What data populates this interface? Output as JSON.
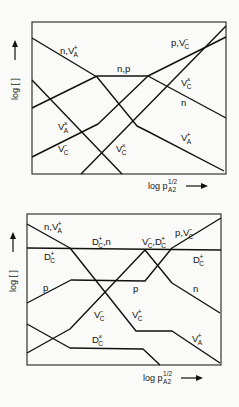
{
  "chart_data": [
    {
      "type": "line",
      "title": "",
      "xlabel": "log p_A2^1/2",
      "ylabel": "log [ ]",
      "grid": false,
      "frame": {
        "x0": 32,
        "y0": 22,
        "x1": 226,
        "y1": 174
      },
      "series": [
        {
          "name": "n, V_A+ / n / V_A+",
          "points": [
            [
              32,
              38
            ],
            [
              97,
              77
            ],
            [
              137,
              126
            ],
            [
              147,
              131
            ],
            [
              224,
              171
            ]
          ]
        },
        {
          "name": "p / n,p / p, V_C-",
          "points": [
            [
              32,
              108
            ],
            [
              97,
              76
            ],
            [
              148,
              76
            ],
            [
              226,
              37
            ]
          ]
        },
        {
          "name": "n (high pressure)",
          "points": [
            [
              148,
              76
            ],
            [
              226,
              118
            ]
          ]
        },
        {
          "name": "V_A^x",
          "points": [
            [
              32,
              80
            ],
            [
              122,
              174
            ]
          ]
        },
        {
          "name": "V_C-",
          "points": [
            [
              32,
              157
            ],
            [
              98,
              124
            ],
            [
              148,
              76
            ]
          ]
        },
        {
          "name": "V_C^x",
          "points": [
            [
              81,
              174
            ],
            [
              226,
              26
            ]
          ]
        }
      ],
      "labels": [
        {
          "base": "n,V",
          "sup": "+",
          "sub": "A",
          "x": 60,
          "y": 54
        },
        {
          "base": "n,p",
          "sup": "",
          "sub": "",
          "x": 117,
          "y": 72
        },
        {
          "base": "p,V",
          "sup": "−",
          "sub": "C",
          "x": 171,
          "y": 46
        },
        {
          "base": "V",
          "sup": "×",
          "sub": "C",
          "x": 181,
          "y": 86
        },
        {
          "base": "n",
          "sup": "",
          "sub": "",
          "x": 181,
          "y": 106
        },
        {
          "base": "V",
          "sup": "×",
          "sub": "A",
          "x": 58,
          "y": 130
        },
        {
          "base": "V",
          "sup": "−",
          "sub": "C",
          "x": 58,
          "y": 152
        },
        {
          "base": "V",
          "sup": "×",
          "sub": "C",
          "x": 116,
          "y": 152
        },
        {
          "base": "V",
          "sup": "+",
          "sub": "A",
          "x": 181,
          "y": 141
        }
      ],
      "x_axis_label": {
        "text": "log p",
        "sup": "1/2",
        "sub": "A2",
        "x": 148,
        "y": 189
      },
      "y_axis_label": {
        "text": "log [ ]",
        "x": 18,
        "y": 70
      }
    },
    {
      "type": "line",
      "title": "",
      "xlabel": "log p_A2^1/2",
      "ylabel": "log [ ]",
      "grid": false,
      "frame": {
        "x0": 27,
        "y0": 214,
        "x1": 221,
        "y1": 365
      },
      "series": [
        {
          "name": "D_C+ (constant)",
          "points": [
            [
              27,
              248
            ],
            [
              221,
              250
            ]
          ]
        },
        {
          "name": "n, V_A+ / V_C+ / V_A+",
          "points": [
            [
              27,
              224
            ],
            [
              70,
              248
            ],
            [
              136,
              331
            ],
            [
              172,
              331
            ],
            [
              220,
              363
            ]
          ]
        },
        {
          "name": "p / p, V_C-",
          "points": [
            [
              27,
              303
            ],
            [
              71,
              280
            ],
            [
              145,
              281
            ],
            [
              172,
              248
            ],
            [
              221,
              218
            ]
          ]
        },
        {
          "name": "V_C- / n",
          "points": [
            [
              27,
              353
            ],
            [
              70,
              329
            ],
            [
              145,
              250
            ],
            [
              172,
              283
            ],
            [
              220,
              313
            ]
          ]
        },
        {
          "name": "D_C^x",
          "points": [
            [
              27,
              324
            ],
            [
              70,
              348
            ],
            [
              143,
              349
            ],
            [
              160,
              365
            ]
          ]
        }
      ],
      "labels": [
        {
          "base": "n,V",
          "sup": "+",
          "sub": "A",
          "x": 44,
          "y": 230
        },
        {
          "base": "D",
          "sup": "+",
          "sub": "C",
          "x": 44,
          "y": 260
        },
        {
          "base": "D",
          "sup": "+",
          "sub": "C",
          "base2": ",n",
          "x": 92,
          "y": 245
        },
        {
          "base": "V",
          "sup": "−",
          "sub": "C",
          "base2": ",D",
          "sup2": "+",
          "sub2": "C",
          "x": 142,
          "y": 245
        },
        {
          "base": "p,V",
          "sup": "−",
          "sub": "C",
          "x": 175,
          "y": 236
        },
        {
          "base": "D",
          "sup": "+",
          "sub": "C",
          "x": 193,
          "y": 263
        },
        {
          "base": "p",
          "sup": "",
          "sub": "",
          "x": 43,
          "y": 291
        },
        {
          "base": "p",
          "sup": "",
          "sub": "",
          "x": 133,
          "y": 292
        },
        {
          "base": "n",
          "sup": "",
          "sub": "",
          "x": 193,
          "y": 292
        },
        {
          "base": "V",
          "sup": "−",
          "sub": "C",
          "x": 94,
          "y": 318
        },
        {
          "base": "V",
          "sup": "+",
          "sub": "C",
          "x": 132,
          "y": 318
        },
        {
          "base": "D",
          "sup": "×",
          "sub": "C",
          "x": 92,
          "y": 343
        },
        {
          "base": "V",
          "sup": "+",
          "sub": "A",
          "x": 192,
          "y": 342
        }
      ],
      "x_axis_label": {
        "text": "log p",
        "sup": "1/2",
        "sub": "A2",
        "x": 143,
        "y": 381
      },
      "y_axis_label": {
        "text": "log [ ]",
        "x": 16,
        "y": 262
      }
    }
  ]
}
